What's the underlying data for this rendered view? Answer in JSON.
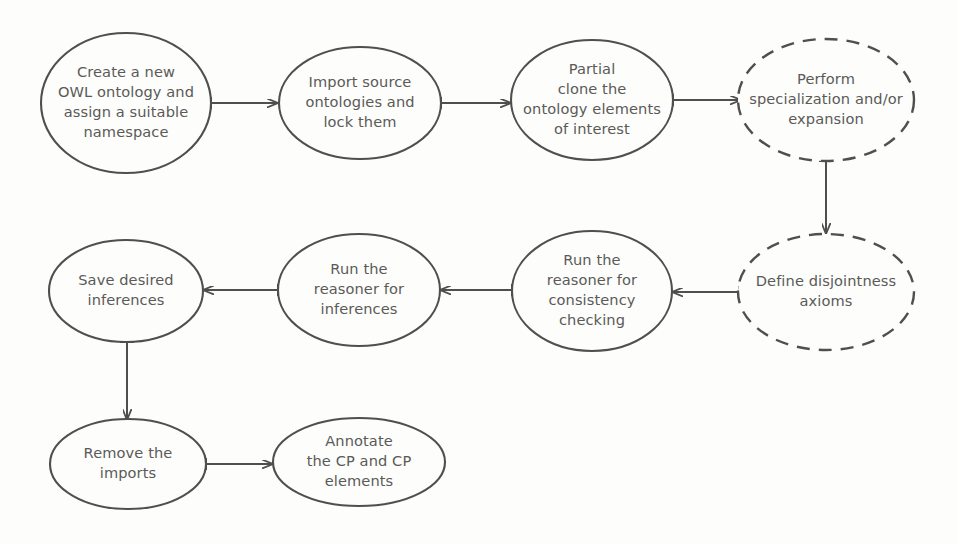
{
  "diagram": {
    "background_color": "#fdfdfb",
    "stroke_color": "#4f4f4f",
    "text_color": "#5a5a58",
    "nodes": [
      {
        "id": "create-ontology",
        "name": "create-new-owl-ontology-node",
        "lines": [
          "Create a new",
          "OWL ontology and",
          "assign a suitable",
          "namespace"
        ],
        "style": "solid",
        "cx": 126,
        "cy": 103,
        "rx": 85,
        "ry": 70
      },
      {
        "id": "import-source",
        "name": "import-source-ontologies-node",
        "lines": [
          "Import source",
          "ontologies and",
          "lock them"
        ],
        "style": "solid",
        "cx": 360,
        "cy": 103,
        "rx": 81,
        "ry": 56
      },
      {
        "id": "partial-clone",
        "name": "partial-clone-elements-node",
        "lines": [
          "Partial",
          "clone the",
          "ontology elements",
          "of interest"
        ],
        "style": "solid",
        "cx": 592,
        "cy": 100,
        "rx": 81,
        "ry": 60
      },
      {
        "id": "perform-specialization",
        "name": "perform-specialization-expansion-node",
        "lines": [
          "Perform",
          "specialization and/or",
          "expansion"
        ],
        "style": "dashed",
        "cx": 826,
        "cy": 100,
        "rx": 88,
        "ry": 61
      },
      {
        "id": "define-disjointness",
        "name": "define-disjointness-axioms-node",
        "lines": [
          "Define disjointness",
          "axioms"
        ],
        "style": "dashed",
        "cx": 826,
        "cy": 292,
        "rx": 88,
        "ry": 58
      },
      {
        "id": "reasoner-consistency",
        "name": "run-reasoner-consistency-checking-node",
        "lines": [
          "Run the",
          "reasoner for",
          "consistency",
          "checking"
        ],
        "style": "solid",
        "cx": 592,
        "cy": 291,
        "rx": 80,
        "ry": 60
      },
      {
        "id": "reasoner-inferences",
        "name": "run-reasoner-inferences-node",
        "lines": [
          "Run the",
          "reasoner for",
          "inferences"
        ],
        "style": "solid",
        "cx": 359,
        "cy": 290,
        "rx": 81,
        "ry": 56
      },
      {
        "id": "save-inferences",
        "name": "save-desired-inferences-node",
        "lines": [
          "Save desired",
          "inferences"
        ],
        "style": "solid",
        "cx": 126,
        "cy": 291,
        "rx": 77,
        "ry": 51
      },
      {
        "id": "remove-imports",
        "name": "remove-the-imports-node",
        "lines": [
          "Remove the",
          "imports"
        ],
        "style": "solid",
        "cx": 128,
        "cy": 464,
        "rx": 78,
        "ry": 45
      },
      {
        "id": "annotate-cp",
        "name": "annotate-cp-elements-node",
        "lines": [
          "Annotate",
          "the CP and CP",
          "elements"
        ],
        "style": "solid",
        "cx": 359,
        "cy": 462,
        "rx": 86,
        "ry": 44
      }
    ],
    "edges": [
      {
        "id": "e1",
        "name": "edge-create-to-import",
        "from": "create-ontology",
        "to": "import-source",
        "direction": "right",
        "x1": 211,
        "y1": 103,
        "x2": 277,
        "y2": 103
      },
      {
        "id": "e2",
        "name": "edge-import-to-partial-clone",
        "from": "import-source",
        "to": "partial-clone",
        "direction": "right",
        "x1": 441,
        "y1": 103,
        "x2": 510,
        "y2": 103
      },
      {
        "id": "e3",
        "name": "edge-partial-clone-to-specialization",
        "from": "partial-clone",
        "to": "perform-specialization",
        "direction": "right",
        "x1": 673,
        "y1": 100,
        "x2": 740,
        "y2": 100
      },
      {
        "id": "e4",
        "name": "edge-specialization-to-disjointness",
        "from": "perform-specialization",
        "to": "define-disjointness",
        "direction": "down",
        "x1": 826,
        "y1": 161,
        "x2": 826,
        "y2": 233
      },
      {
        "id": "e5",
        "name": "edge-disjointness-to-consistency",
        "from": "define-disjointness",
        "to": "reasoner-consistency",
        "direction": "left",
        "x1": 739,
        "y1": 292,
        "x2": 673,
        "y2": 292
      },
      {
        "id": "e6",
        "name": "edge-consistency-to-inferences",
        "from": "reasoner-consistency",
        "to": "reasoner-inferences",
        "direction": "left",
        "x1": 512,
        "y1": 290,
        "x2": 441,
        "y2": 290
      },
      {
        "id": "e7",
        "name": "edge-inferences-to-save",
        "from": "reasoner-inferences",
        "to": "save-inferences",
        "direction": "left",
        "x1": 278,
        "y1": 290,
        "x2": 204,
        "y2": 290
      },
      {
        "id": "e8",
        "name": "edge-save-to-remove-imports",
        "from": "save-inferences",
        "to": "remove-imports",
        "direction": "down",
        "x1": 127,
        "y1": 342,
        "x2": 127,
        "y2": 419
      },
      {
        "id": "e9",
        "name": "edge-remove-imports-to-annotate",
        "from": "remove-imports",
        "to": "annotate-cp",
        "direction": "right",
        "x1": 206,
        "y1": 464,
        "x2": 272,
        "y2": 464
      }
    ]
  }
}
